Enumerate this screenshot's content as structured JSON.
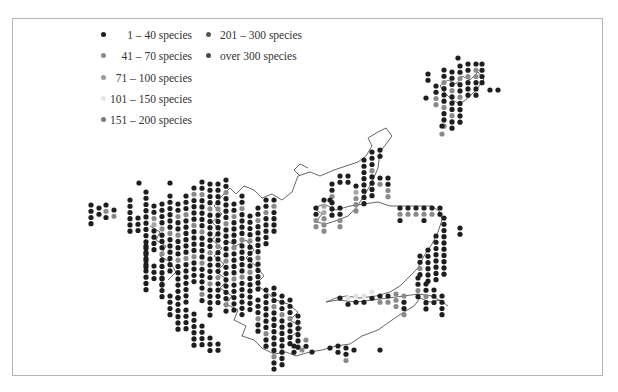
{
  "legend": {
    "items": [
      {
        "label": "1 –  40 species",
        "color": "#1e1e1e",
        "x": 104,
        "y": 35
      },
      {
        "label": "41 –  70 species",
        "color": "#8a8a8a",
        "x": 104,
        "y": 56
      },
      {
        "label": "71 – 100 species",
        "color": "#9c9c9c",
        "x": 104,
        "y": 78
      },
      {
        "label": "101 – 150 species",
        "color": "#e6e6e6",
        "x": 104,
        "y": 99
      },
      {
        "label": "151 – 200 species",
        "color": "#7a7a7a",
        "x": 104,
        "y": 120
      },
      {
        "label": "201 – 300 species",
        "color": "#555555",
        "x": 209,
        "y": 35
      },
      {
        "label": "over 300 species",
        "color": "#4a4a4a",
        "x": 209,
        "y": 56
      }
    ]
  },
  "map": {
    "frame_color": "#b5b5b5",
    "coast_color": "#555555",
    "dot_spacing": 8,
    "dot_radius": 2.6,
    "palette": [
      "#1e1e1e",
      "#8a8a8a",
      "#a8a8a8",
      "#e2e2e2",
      "#6e6e6e",
      "#444444"
    ],
    "columns": [
      {
        "x": 91,
        "y0": 205,
        "n": 4,
        "pattern": "0000"
      },
      {
        "x": 99,
        "y0": 208,
        "n": 2,
        "pattern": "00"
      },
      {
        "x": 106,
        "y0": 205,
        "n": 3,
        "pattern": "010"
      },
      {
        "x": 114,
        "y0": 210,
        "n": 2,
        "pattern": "01"
      },
      {
        "x": 130,
        "y0": 200,
        "n": 6,
        "pattern": "000000"
      },
      {
        "x": 138,
        "y0": 218,
        "n": 3,
        "pattern": "000"
      },
      {
        "x": 139,
        "y0": 183,
        "n": 1,
        "pattern": "0"
      },
      {
        "x": 146,
        "y0": 192,
        "n": 13,
        "pattern": "0000000000000"
      },
      {
        "x": 146,
        "y0": 246,
        "n": 8,
        "pattern": "00000000"
      },
      {
        "x": 154,
        "y0": 206,
        "n": 8,
        "pattern": "00120000"
      },
      {
        "x": 154,
        "y0": 266,
        "n": 3,
        "pattern": "000"
      },
      {
        "x": 162,
        "y0": 204,
        "n": 14,
        "pattern": "00001000100000"
      },
      {
        "x": 162,
        "y0": 278,
        "n": 4,
        "pattern": "0000"
      },
      {
        "x": 170,
        "y0": 183,
        "n": 1,
        "pattern": "0"
      },
      {
        "x": 170,
        "y0": 196,
        "n": 13,
        "pattern": "0000001000000"
      },
      {
        "x": 170,
        "y0": 296,
        "n": 4,
        "pattern": "0000"
      },
      {
        "x": 178,
        "y0": 204,
        "n": 16,
        "pattern": "0010010001000000"
      },
      {
        "x": 178,
        "y0": 298,
        "n": 6,
        "pattern": "000000"
      },
      {
        "x": 186,
        "y0": 196,
        "n": 18,
        "pattern": "000100000010000000"
      },
      {
        "x": 186,
        "y0": 310,
        "n": 4,
        "pattern": "0000"
      },
      {
        "x": 194,
        "y0": 188,
        "n": 16,
        "pattern": "0100001000010000"
      },
      {
        "x": 194,
        "y0": 314,
        "n": 6,
        "pattern": "000000"
      },
      {
        "x": 202,
        "y0": 182,
        "n": 20,
        "pattern": "00100000100001000010"
      },
      {
        "x": 202,
        "y0": 326,
        "n": 4,
        "pattern": "0000"
      },
      {
        "x": 210,
        "y0": 184,
        "n": 22,
        "pattern": "0000100000010000100000"
      },
      {
        "x": 210,
        "y0": 338,
        "n": 3,
        "pattern": "000"
      },
      {
        "x": 218,
        "y0": 184,
        "n": 20,
        "pattern": "00001000001000010000"
      },
      {
        "x": 218,
        "y0": 344,
        "n": 2,
        "pattern": "00"
      },
      {
        "x": 226,
        "y0": 180,
        "n": 22,
        "pattern": "0010000100000100000010"
      },
      {
        "x": 234,
        "y0": 204,
        "n": 18,
        "pattern": "001000010000100000"
      },
      {
        "x": 242,
        "y0": 196,
        "n": 20,
        "pattern": "00100001000001000000"
      },
      {
        "x": 250,
        "y0": 216,
        "n": 16,
        "pattern": "0000100001000000"
      },
      {
        "x": 258,
        "y0": 208,
        "n": 14,
        "pattern": "00100000100000"
      },
      {
        "x": 258,
        "y0": 300,
        "n": 6,
        "pattern": "000100"
      },
      {
        "x": 266,
        "y0": 200,
        "n": 8,
        "pattern": "00100000"
      },
      {
        "x": 266,
        "y0": 290,
        "n": 10,
        "pattern": "0000000100"
      },
      {
        "x": 274,
        "y0": 200,
        "n": 6,
        "pattern": "010000"
      },
      {
        "x": 274,
        "y0": 288,
        "n": 14,
        "pattern": "00010000000100"
      },
      {
        "x": 282,
        "y0": 296,
        "n": 12,
        "pattern": "000100000000"
      },
      {
        "x": 290,
        "y0": 300,
        "n": 8,
        "pattern": "00010000"
      },
      {
        "x": 298,
        "y0": 316,
        "n": 6,
        "pattern": "000000"
      },
      {
        "x": 306,
        "y0": 340,
        "n": 2,
        "pattern": "10"
      },
      {
        "x": 316,
        "y0": 208,
        "n": 4,
        "pattern": "0011"
      },
      {
        "x": 324,
        "y0": 200,
        "n": 6,
        "pattern": "022111"
      },
      {
        "x": 332,
        "y0": 184,
        "n": 6,
        "pattern": "001000"
      },
      {
        "x": 340,
        "y0": 176,
        "n": 2,
        "pattern": "00"
      },
      {
        "x": 340,
        "y0": 208,
        "n": 4,
        "pattern": "0011"
      },
      {
        "x": 348,
        "y0": 176,
        "n": 2,
        "pattern": "00"
      },
      {
        "x": 356,
        "y0": 186,
        "n": 5,
        "pattern": "02111"
      },
      {
        "x": 364,
        "y0": 160,
        "n": 8,
        "pattern": "00000000"
      },
      {
        "x": 372,
        "y0": 152,
        "n": 8,
        "pattern": "00010000"
      },
      {
        "x": 380,
        "y0": 150,
        "n": 2,
        "pattern": "00"
      },
      {
        "x": 380,
        "y0": 178,
        "n": 2,
        "pattern": "01"
      },
      {
        "x": 388,
        "y0": 178,
        "n": 4,
        "pattern": "0011"
      },
      {
        "x": 400,
        "y0": 208,
        "n": 3,
        "pattern": "010"
      },
      {
        "x": 408,
        "y0": 208,
        "n": 2,
        "pattern": "01"
      },
      {
        "x": 416,
        "y0": 208,
        "n": 2,
        "pattern": "01"
      },
      {
        "x": 424,
        "y0": 208,
        "n": 3,
        "pattern": "010"
      },
      {
        "x": 432,
        "y0": 208,
        "n": 2,
        "pattern": "01"
      },
      {
        "x": 440,
        "y0": 208,
        "n": 2,
        "pattern": "00"
      },
      {
        "x": 444,
        "y0": 218,
        "n": 10,
        "pattern": "0000000000"
      },
      {
        "x": 436,
        "y0": 236,
        "n": 8,
        "pattern": "00000000"
      },
      {
        "x": 428,
        "y0": 250,
        "n": 6,
        "pattern": "000000"
      },
      {
        "x": 420,
        "y0": 256,
        "n": 4,
        "pattern": "0010"
      },
      {
        "x": 460,
        "y0": 228,
        "n": 2,
        "pattern": "00"
      },
      {
        "x": 418,
        "y0": 278,
        "n": 4,
        "pattern": "0010"
      },
      {
        "x": 426,
        "y0": 284,
        "n": 5,
        "pattern": "00100"
      },
      {
        "x": 434,
        "y0": 290,
        "n": 3,
        "pattern": "000"
      },
      {
        "x": 442,
        "y0": 296,
        "n": 4,
        "pattern": "0000"
      },
      {
        "x": 404,
        "y0": 296,
        "n": 4,
        "pattern": "1001"
      },
      {
        "x": 396,
        "y0": 294,
        "n": 3,
        "pattern": "111"
      },
      {
        "x": 388,
        "y0": 296,
        "n": 2,
        "pattern": "01"
      },
      {
        "x": 380,
        "y0": 296,
        "n": 2,
        "pattern": "01"
      },
      {
        "x": 372,
        "y0": 292,
        "n": 2,
        "pattern": "30"
      },
      {
        "x": 364,
        "y0": 296,
        "n": 2,
        "pattern": "30"
      },
      {
        "x": 356,
        "y0": 296,
        "n": 2,
        "pattern": "30"
      },
      {
        "x": 348,
        "y0": 298,
        "n": 2,
        "pattern": "30"
      },
      {
        "x": 340,
        "y0": 298,
        "n": 1,
        "pattern": "0"
      },
      {
        "x": 330,
        "y0": 348,
        "n": 1,
        "pattern": "0"
      },
      {
        "x": 338,
        "y0": 346,
        "n": 2,
        "pattern": "00"
      },
      {
        "x": 346,
        "y0": 348,
        "n": 3,
        "pattern": "001"
      },
      {
        "x": 354,
        "y0": 350,
        "n": 1,
        "pattern": "0"
      },
      {
        "x": 380,
        "y0": 350,
        "n": 1,
        "pattern": "0"
      },
      {
        "x": 312,
        "y0": 352,
        "n": 1,
        "pattern": "0"
      },
      {
        "x": 294,
        "y0": 346,
        "n": 2,
        "pattern": "00"
      },
      {
        "x": 302,
        "y0": 350,
        "n": 1,
        "pattern": "1"
      },
      {
        "x": 330,
        "y0": 200,
        "n": 1,
        "pattern": "0"
      },
      {
        "x": 428,
        "y0": 74,
        "n": 2,
        "pattern": "00"
      },
      {
        "x": 436,
        "y0": 86,
        "n": 4,
        "pattern": "0011"
      },
      {
        "x": 444,
        "y0": 70,
        "n": 10,
        "pattern": "0010001001"
      },
      {
        "x": 452,
        "y0": 72,
        "n": 10,
        "pattern": "0001000100"
      },
      {
        "x": 460,
        "y0": 66,
        "n": 10,
        "pattern": "0010010000"
      },
      {
        "x": 468,
        "y0": 64,
        "n": 6,
        "pattern": "001000"
      },
      {
        "x": 476,
        "y0": 64,
        "n": 6,
        "pattern": "011000"
      },
      {
        "x": 482,
        "y0": 64,
        "n": 4,
        "pattern": "0000"
      },
      {
        "x": 458,
        "y0": 58,
        "n": 1,
        "pattern": "0"
      },
      {
        "x": 490,
        "y0": 90,
        "n": 1,
        "pattern": "0"
      },
      {
        "x": 498,
        "y0": 90,
        "n": 1,
        "pattern": "0"
      },
      {
        "x": 426,
        "y0": 98,
        "n": 1,
        "pattern": "0"
      },
      {
        "x": 442,
        "y0": 126,
        "n": 1,
        "pattern": "0"
      },
      {
        "x": 442,
        "y0": 134,
        "n": 1,
        "pattern": "1"
      }
    ],
    "coastlines": [
      "M222,196 L230,188 L236,194 L244,186 L254,190 L262,198 L272,194 L282,200 L292,192 L298,176 L310,172 L320,176 L334,170 L346,166 L358,162 L366,156 L372,146 L368,138 L378,132 L386,128 L392,136 L386,144 L380,152",
      "M222,196 L214,206 L222,214 L212,222 L220,230 L212,240 L222,248 L214,256 L224,264 L216,272 L228,280 L220,288 L232,296 L226,304 L238,310 L234,320 L246,326 L242,336 L254,340 L262,348 L274,354 L286,352 L296,356 L310,352 L322,350 L336,346 L350,344 L362,336 L378,330 L392,320 L404,312 L414,306 L420,298 L430,302 L440,300 L448,306",
      "M380,152 L378,168 L372,182 L364,196 L356,208 L348,216 L338,220 L326,224 L316,222 L322,214 L314,208 L324,204 L336,210 L350,206 L364,204 L378,202 L390,206 L404,206 L418,206 L432,206 L440,212 L442,220 L438,232 L432,244 L424,256 L418,268 L410,276 L400,286 L390,292 L376,296 L360,298 L346,296",
      "M346,296 L336,298 L326,302 L338,300 L356,302 L372,300 L388,298 L404,296 L418,294 L432,296 L442,302",
      "M226,240 L236,246 L246,240 L254,250 L246,258 L256,266 L264,276 L256,284 L266,292 L276,300 L288,304 L298,312 L290,320 L302,328 L292,336",
      "M440,86 L448,80 L456,84 L462,76 L470,80 L478,72 L484,80 L476,90 L468,98 L460,104 L452,100 L446,94 L440,86",
      "M150,226 L160,232 L156,240 L166,246 L160,256 L170,262 L176,272 L168,280",
      "M300,176 L294,170 L300,164 L308,168"
    ]
  }
}
